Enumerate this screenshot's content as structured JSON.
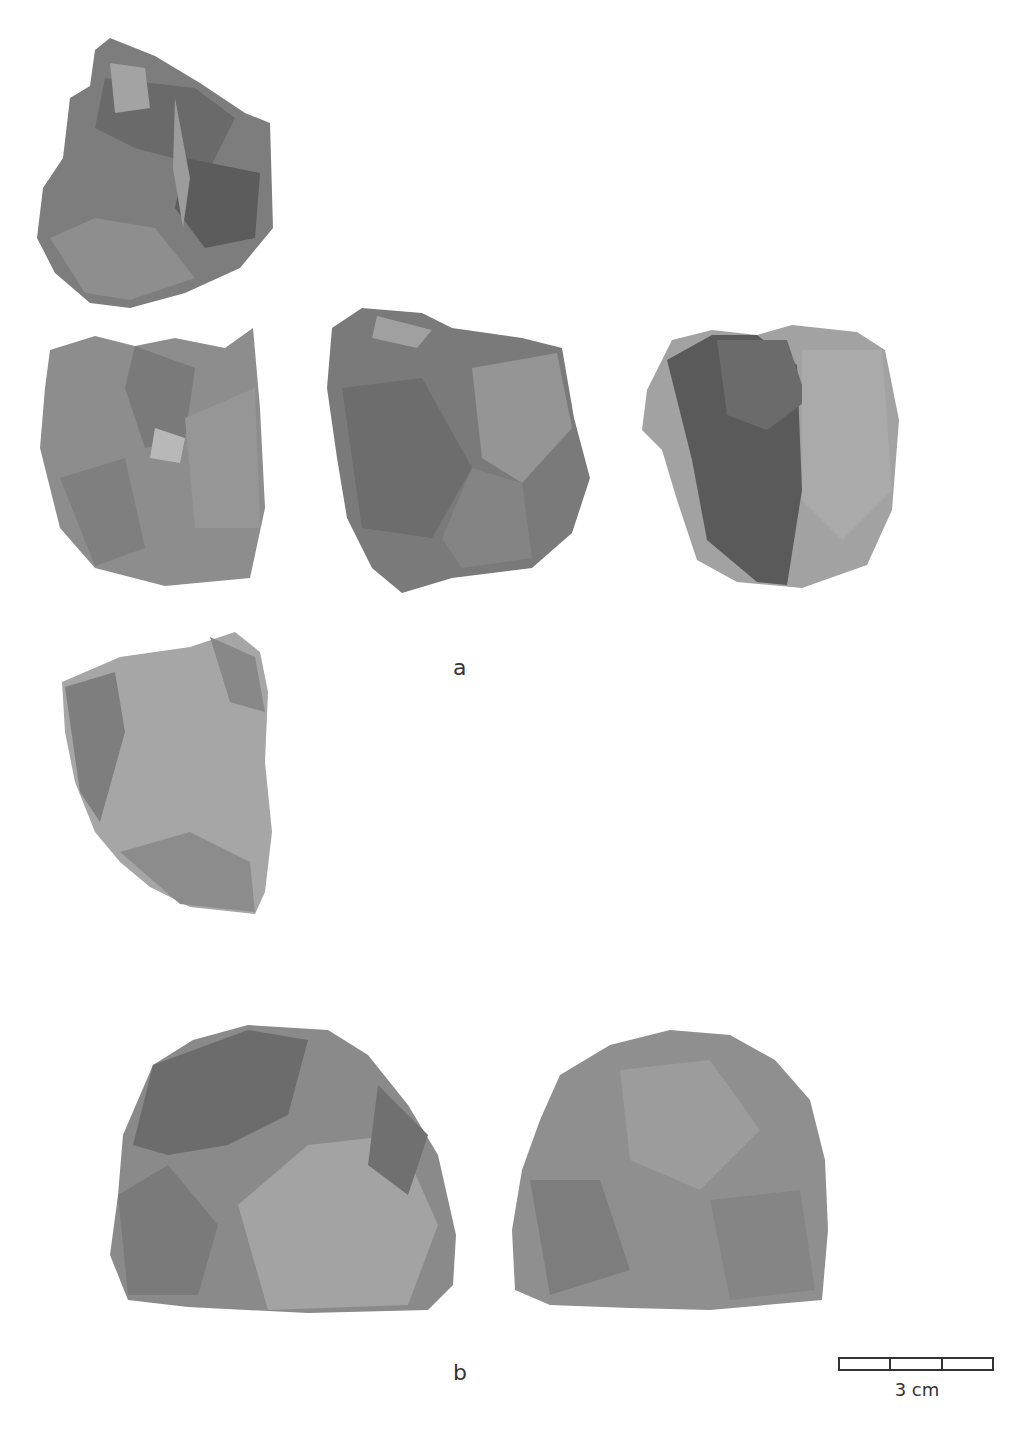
{
  "figure": {
    "groups": [
      {
        "id": "a",
        "label": "a",
        "views": 5
      },
      {
        "id": "b",
        "label": "b",
        "views": 2
      }
    ],
    "scale_bar": {
      "label": "3 cm",
      "segments": 3
    },
    "colors": {
      "background": "#ffffff",
      "stone_dark": "#5f5f5f",
      "stone_mid": "#858585",
      "stone_light": "#a9a9a9",
      "text": "#333333"
    }
  }
}
